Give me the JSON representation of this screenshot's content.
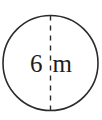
{
  "figure": {
    "shape": "circle",
    "background_color": "#ffffff",
    "stroke_color": "#2b2b2b",
    "text_color": "#1c1c1c"
  },
  "circle": {
    "name": "circle-outline",
    "center_x": 50.5,
    "center_y": 63,
    "radius": 47.5,
    "stroke_width": 1.6
  },
  "diameter_line": {
    "name": "diameter-dashed-line",
    "orientation": "vertical",
    "x": 50.5,
    "y_start": 15.5,
    "y_end": 110.5,
    "dash": "5 5",
    "stroke_width": 1.4
  },
  "label": {
    "full_text": "6 m",
    "value": "6",
    "unit": "m",
    "font_size": 25,
    "center_y": 63
  },
  "chart_data": {
    "type": "diagram",
    "title": "",
    "annotations": [
      {
        "text": "6 m",
        "role": "diameter-measurement",
        "value": 6,
        "unit": "m"
      }
    ]
  }
}
